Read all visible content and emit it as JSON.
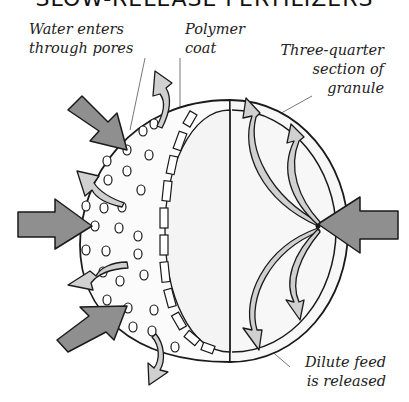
{
  "title": "SLOW-RELEASE FERTILIZERS",
  "labels": {
    "water": "Water enters\nthrough pores",
    "polymer": "Polymer\ncoat",
    "section": "Three-quarter\nsection of\ngranule",
    "dilute": "Dilute feed\nis released"
  },
  "colors": {
    "inflow_arrow": "#8f8f8f",
    "outflow_arrow": "#cfcfcf",
    "outline": "#1a1a1a",
    "interior": "#f7f7f7"
  }
}
